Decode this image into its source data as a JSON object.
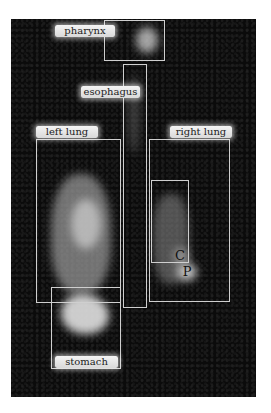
{
  "figure": {
    "labels": {
      "pharynx": "pharynx",
      "esophagus": "esophagus",
      "left_lung": "left lung",
      "right_lung": "right lung",
      "stomach": "stomach",
      "marker_c": "C",
      "marker_p": "P"
    },
    "colors": {
      "background": "#ffffff",
      "scan": "#0b0b0b",
      "box_outline": "#cfcfcf",
      "label_bg": "#e6e6e6",
      "label_text": "#222222"
    }
  }
}
